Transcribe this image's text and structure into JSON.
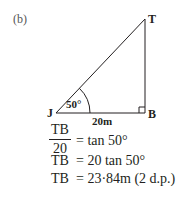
{
  "part_label": "(b)",
  "diagram": {
    "points": {
      "T": "T",
      "J": "J",
      "B": "B"
    },
    "angle_label": "50°",
    "base_label": "20m",
    "right_angle_at": "B"
  },
  "equations": {
    "line1": {
      "numerator": "TB",
      "denominator": "20",
      "rhs": "= tan 50°"
    },
    "line2": {
      "lhs": "TB",
      "rhs": "= 20 tan 50°"
    },
    "line3": {
      "lhs": "TB",
      "rhs": "= 23·84m (2 d.p.)"
    }
  }
}
